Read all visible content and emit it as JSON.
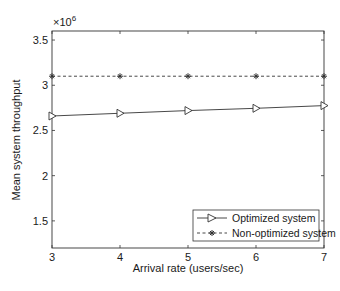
{
  "chart_data": {
    "type": "line",
    "title": "",
    "xlabel": "Arrival rate (users/sec)",
    "ylabel": "Mean system throughput",
    "y_multiplier_label": "×10^6",
    "y_multiplier_base": "×10",
    "y_multiplier_exp": "6",
    "x": [
      3,
      4,
      5,
      6,
      7
    ],
    "xlim": [
      3,
      7
    ],
    "ylim": [
      1.2,
      3.6
    ],
    "x_ticks": [
      "3",
      "4",
      "5",
      "6",
      "7"
    ],
    "y_ticks": [
      "1.5",
      "2",
      "2.5",
      "3",
      "3.5"
    ],
    "grid": false,
    "legend_position": "lower right",
    "series": [
      {
        "name": "Optimized system",
        "line_style": "solid",
        "marker": "triangle-right",
        "values": [
          2.66,
          2.69,
          2.72,
          2.745,
          2.775
        ]
      },
      {
        "name": "Non-optimized system",
        "line_style": "dashed",
        "marker": "asterisk",
        "values": [
          3.1,
          3.1,
          3.1,
          3.1,
          3.1
        ]
      }
    ]
  }
}
